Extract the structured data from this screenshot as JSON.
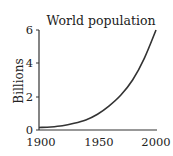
{
  "chart_data": {
    "type": "line",
    "title": "World population",
    "xlabel": "",
    "ylabel": "Billions",
    "xlim": [
      1900,
      2000
    ],
    "ylim": [
      0,
      6
    ],
    "x_ticks": [
      "1900",
      "1950",
      "2000"
    ],
    "y_ticks": [
      "0",
      "2",
      "4",
      "6"
    ],
    "grid": false,
    "legend": null,
    "series": [
      {
        "name": "World population",
        "x": [
          1900,
          1910,
          1920,
          1930,
          1940,
          1950,
          1960,
          1970,
          1980,
          1990,
          2000
        ],
        "values": [
          0.15,
          0.18,
          0.25,
          0.4,
          0.6,
          0.95,
          1.45,
          2.1,
          3.0,
          4.3,
          6.0
        ]
      }
    ],
    "colors": {
      "line": "#333333",
      "axis": "#333333",
      "text": "#222222"
    }
  }
}
